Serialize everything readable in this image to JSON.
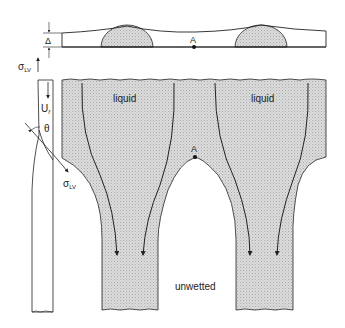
{
  "labels": {
    "delta": "Δ",
    "point_a_top": "A",
    "point_a_main": "A",
    "sigma": "σ",
    "sigma_sub": "LV",
    "sigma2": "σ",
    "sigma2_sub": "LV",
    "velocity": "U",
    "velocity_sub": "f",
    "theta": "θ",
    "liquid_left": "liquid",
    "liquid_right": "liquid",
    "unwetted": "unwetted"
  },
  "colors": {
    "fill": "#d9d9d9",
    "stroke": "#222222",
    "background": "#ffffff"
  }
}
